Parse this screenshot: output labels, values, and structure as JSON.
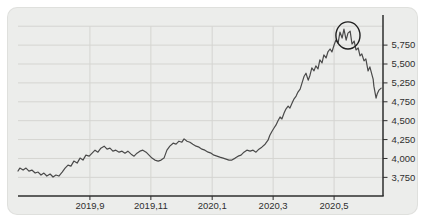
{
  "panel": {
    "background": "#ecedeb",
    "border_color": "#dcdcd8"
  },
  "chart_data": {
    "type": "line",
    "line_color": "#4a4a4a",
    "axis_color": "#2e2e2e",
    "gridline_color": "#d5d5d1",
    "label_color": "#2f2f2f",
    "x_axis": {
      "ticks": [
        {
          "label": "2019,9",
          "frac": 0.197
        },
        {
          "label": "2019,11",
          "frac": 0.364
        },
        {
          "label": "2020,1",
          "frac": 0.532
        },
        {
          "label": "2020,3",
          "frac": 0.699
        },
        {
          "label": "2020,5",
          "frac": 0.866
        }
      ]
    },
    "y_axis": {
      "side": "right",
      "gridline_count": 9,
      "top_gridline_frac": 0.062,
      "bottom_gridline_frac": 0.897,
      "tick_labels": [
        "5,750",
        "5,500",
        "5,250",
        "4,750",
        "4,500",
        "4,250",
        "4,000",
        "3,750"
      ],
      "anchors": {
        "value_low": 3750,
        "frac_low": 0.897,
        "value_high": 5750,
        "frac_high": 0.164
      }
    },
    "series": {
      "points": [
        [
          0,
          3845
        ],
        [
          0.005,
          3890
        ],
        [
          0.014,
          3860
        ],
        [
          0.022,
          3890
        ],
        [
          0.03,
          3845
        ],
        [
          0.038,
          3860
        ],
        [
          0.047,
          3815
        ],
        [
          0.055,
          3830
        ],
        [
          0.063,
          3785
        ],
        [
          0.071,
          3815
        ],
        [
          0.079,
          3770
        ],
        [
          0.088,
          3800
        ],
        [
          0.096,
          3755
        ],
        [
          0.104,
          3785
        ],
        [
          0.112,
          3770
        ],
        [
          0.121,
          3830
        ],
        [
          0.129,
          3890
        ],
        [
          0.137,
          3935
        ],
        [
          0.145,
          3920
        ],
        [
          0.153,
          3995
        ],
        [
          0.162,
          3965
        ],
        [
          0.17,
          4040
        ],
        [
          0.178,
          4010
        ],
        [
          0.186,
          4085
        ],
        [
          0.195,
          4070
        ],
        [
          0.203,
          4115
        ],
        [
          0.211,
          4160
        ],
        [
          0.219,
          4130
        ],
        [
          0.227,
          4190
        ],
        [
          0.236,
          4220
        ],
        [
          0.244,
          4175
        ],
        [
          0.252,
          4190
        ],
        [
          0.26,
          4145
        ],
        [
          0.268,
          4160
        ],
        [
          0.277,
          4130
        ],
        [
          0.285,
          4145
        ],
        [
          0.293,
          4115
        ],
        [
          0.301,
          4145
        ],
        [
          0.31,
          4100
        ],
        [
          0.318,
          4070
        ],
        [
          0.326,
          4115
        ],
        [
          0.334,
          4145
        ],
        [
          0.342,
          4160
        ],
        [
          0.351,
          4130
        ],
        [
          0.359,
          4085
        ],
        [
          0.367,
          4040
        ],
        [
          0.375,
          4010
        ],
        [
          0.384,
          3995
        ],
        [
          0.392,
          4010
        ],
        [
          0.4,
          4040
        ],
        [
          0.408,
          4160
        ],
        [
          0.416,
          4220
        ],
        [
          0.425,
          4265
        ],
        [
          0.433,
          4250
        ],
        [
          0.441,
          4295
        ],
        [
          0.449,
          4280
        ],
        [
          0.455,
          4330
        ],
        [
          0.463,
          4295
        ],
        [
          0.471,
          4280
        ],
        [
          0.479,
          4250
        ],
        [
          0.488,
          4220
        ],
        [
          0.496,
          4205
        ],
        [
          0.504,
          4175
        ],
        [
          0.512,
          4160
        ],
        [
          0.521,
          4130
        ],
        [
          0.529,
          4115
        ],
        [
          0.537,
          4085
        ],
        [
          0.545,
          4070
        ],
        [
          0.553,
          4055
        ],
        [
          0.562,
          4040
        ],
        [
          0.57,
          4025
        ],
        [
          0.578,
          4010
        ],
        [
          0.586,
          4010
        ],
        [
          0.595,
          4040
        ],
        [
          0.603,
          4070
        ],
        [
          0.611,
          4085
        ],
        [
          0.619,
          4130
        ],
        [
          0.627,
          4160
        ],
        [
          0.636,
          4145
        ],
        [
          0.644,
          4160
        ],
        [
          0.652,
          4130
        ],
        [
          0.66,
          4175
        ],
        [
          0.668,
          4205
        ],
        [
          0.677,
          4250
        ],
        [
          0.685,
          4310
        ],
        [
          0.69,
          4385
        ],
        [
          0.696,
          4445
        ],
        [
          0.701,
          4490
        ],
        [
          0.707,
          4540
        ],
        [
          0.712,
          4600
        ],
        [
          0.718,
          4660
        ],
        [
          0.723,
          4630
        ],
        [
          0.729,
          4720
        ],
        [
          0.734,
          4780
        ],
        [
          0.74,
          4825
        ],
        [
          0.745,
          4795
        ],
        [
          0.751,
          4870
        ],
        [
          0.756,
          4930
        ],
        [
          0.762,
          4975
        ],
        [
          0.767,
          5035
        ],
        [
          0.773,
          5080
        ],
        [
          0.778,
          5170
        ],
        [
          0.784,
          5275
        ],
        [
          0.789,
          5320
        ],
        [
          0.795,
          5215
        ],
        [
          0.8,
          5290
        ],
        [
          0.805,
          5400
        ],
        [
          0.811,
          5355
        ],
        [
          0.816,
          5430
        ],
        [
          0.822,
          5385
        ],
        [
          0.827,
          5520
        ],
        [
          0.833,
          5475
        ],
        [
          0.838,
          5595
        ],
        [
          0.844,
          5550
        ],
        [
          0.849,
          5640
        ],
        [
          0.855,
          5685
        ],
        [
          0.86,
          5640
        ],
        [
          0.866,
          5745
        ],
        [
          0.871,
          5820
        ],
        [
          0.877,
          5775
        ],
        [
          0.882,
          5940
        ],
        [
          0.888,
          5850
        ],
        [
          0.893,
          5985
        ],
        [
          0.899,
          5820
        ],
        [
          0.904,
          5925
        ],
        [
          0.91,
          5955
        ],
        [
          0.915,
          5760
        ],
        [
          0.921,
          5805
        ],
        [
          0.926,
          5670
        ],
        [
          0.932,
          5700
        ],
        [
          0.937,
          5580
        ],
        [
          0.942,
          5610
        ],
        [
          0.948,
          5505
        ],
        [
          0.953,
          5535
        ],
        [
          0.959,
          5355
        ],
        [
          0.964,
          5415
        ],
        [
          0.97,
          5290
        ],
        [
          0.973,
          5230
        ],
        [
          0.975,
          5125
        ],
        [
          0.978,
          5035
        ],
        [
          0.981,
          4945
        ],
        [
          0.984,
          5005
        ],
        [
          0.989,
          5065
        ],
        [
          0.995,
          5095
        ]
      ]
    },
    "annotation": {
      "shape": "ellipse",
      "cx_frac": 0.904,
      "cy_frac": 0.113,
      "rx_frac": 0.033,
      "ry_frac": 0.075,
      "stroke_color": "#1f1f1f"
    }
  }
}
